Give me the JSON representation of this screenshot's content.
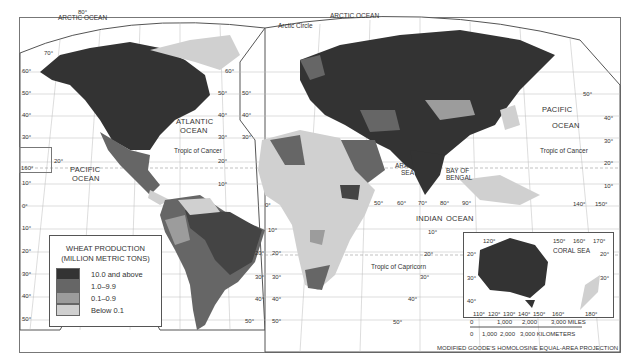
{
  "legend": {
    "title_line1": "WHEAT PRODUCTION",
    "title_line2": "(MILLION METRIC TONS)",
    "items": [
      {
        "label": "10.0 and above",
        "color": "#333333"
      },
      {
        "label": "1.0–9.9",
        "color": "#666666"
      },
      {
        "label": "0.1–0.9",
        "color": "#9c9c9c"
      },
      {
        "label": "Below 0.1",
        "color": "#d0d0d0"
      }
    ]
  },
  "labels": {
    "arctic_ocean_w": "ARCTIC OCEAN",
    "arctic_ocean_e": "ARCTIC OCEAN",
    "arctic_circle": "Arctic Circle",
    "atlantic_1": "ATLANTIC",
    "atlantic_2": "OCEAN",
    "pacific_w_1": "PACIFIC",
    "pacific_w_2": "OCEAN",
    "pacific_e_1": "PACIFIC",
    "pacific_e_2": "OCEAN",
    "indian_1": "INDIAN",
    "indian_2": "OCEAN",
    "arabian_1": "ARABIAN",
    "arabian_2": "SEA",
    "bengal_1": "BAY OF",
    "bengal_2": "BENGAL",
    "tropic_cancer_w": "Tropic of Cancer",
    "tropic_cancer_e": "Tropic of Cancer",
    "tropic_capricorn": "Tropic of Capricorn",
    "coral_sea": "CORAL SEA"
  },
  "degrees": {
    "d80": "80°",
    "d70": "70°",
    "d60": "60°",
    "d50": "50°",
    "d40": "40°",
    "d30": "30°",
    "d20": "20°",
    "d10": "10°",
    "d0": "0°",
    "d90": "90°",
    "d110": "110°",
    "d120": "120°",
    "d130": "130°",
    "d140": "140°",
    "d150": "150°",
    "d160": "160°",
    "d170": "170°",
    "d180": "180°"
  },
  "scale": {
    "miles_ticks": [
      "0",
      "1,000",
      "2,000",
      "3,000 MILES"
    ],
    "km_ticks": [
      "0",
      "1,000",
      "2,000",
      "3,000 KILOMETERS"
    ]
  },
  "projection": "MODIFIED GOODE'S HOMOLOSINE EQUAL-AREA PROJECTION"
}
